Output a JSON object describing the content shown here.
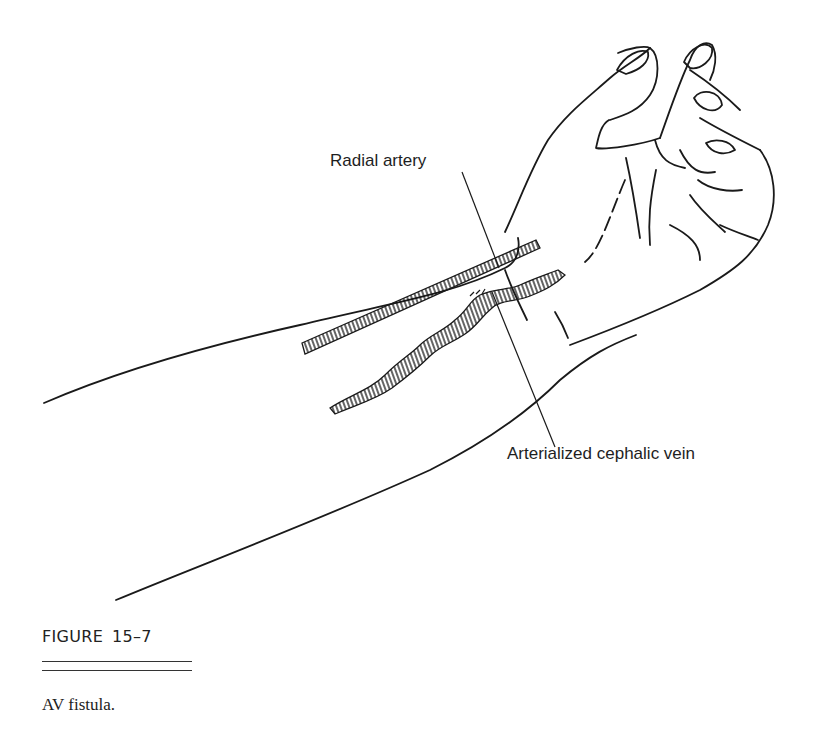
{
  "figure": {
    "labels": {
      "radial_artery": "Radial artery",
      "arterialized_vein": "Arterialized cephalic vein"
    },
    "number_prefix": "FIGURE",
    "number": "15–7",
    "caption": "AV fistula."
  },
  "colors": {
    "background": "#ffffff",
    "ink": "#1a1a1a"
  }
}
